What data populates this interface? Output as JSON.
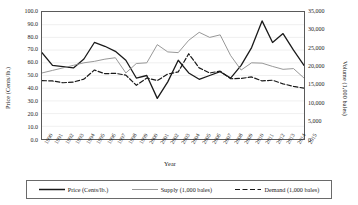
{
  "chart_data": {
    "type": "line",
    "title": "",
    "xlabel": "Year",
    "ylabel": "Price (Cents/lb.)",
    "y2label": "Volume (1,000 bales)",
    "grid": true,
    "legend_position": "bottom",
    "categories": [
      "1990",
      "1991",
      "1992",
      "1993",
      "1994",
      "1995",
      "1996",
      "1997",
      "1998",
      "1999",
      "2000",
      "2001",
      "2002",
      "2003",
      "2004",
      "2005",
      "2006",
      "2007",
      "2008",
      "2009",
      "2010",
      "2011",
      "2012",
      "2013",
      "2014",
      "2015"
    ],
    "ylim": [
      0.0,
      100.0
    ],
    "ytick_step": 10.0,
    "yticks": [
      "100.0",
      "90.0",
      "80.0",
      "70.0",
      "60.0",
      "50.0",
      "40.0",
      "30.0",
      "20.0",
      "10.0",
      "0.0"
    ],
    "y2lim": [
      0,
      35000
    ],
    "y2tick_step": 5000,
    "y2ticks": [
      "35,000",
      "30,000",
      "25,000",
      "20,000",
      "15,000",
      "10,000",
      "5,000",
      "0"
    ],
    "series": [
      {
        "name": "Price (Cents/lb.)",
        "axis": "left",
        "style": "solid",
        "color": "#1a1a1a",
        "width": 1.3,
        "values": [
          68.0,
          58.0,
          57.0,
          56.0,
          63.0,
          76.0,
          73.0,
          69.0,
          62.0,
          48.0,
          50.0,
          32.0,
          45.0,
          62.0,
          52.0,
          47.0,
          50.0,
          53.0,
          48.0,
          58.0,
          72.0,
          93.0,
          76.0,
          83.0,
          70.0,
          58.0
        ]
      },
      {
        "name": "Supply (1,000 bales)",
        "axis": "right",
        "style": "thin-solid",
        "color": "#8c8c8c",
        "width": 0.9,
        "values": [
          18200,
          18900,
          19600,
          20300,
          21000,
          21400,
          22000,
          22400,
          18200,
          20800,
          21000,
          26000,
          24000,
          23800,
          27200,
          29400,
          28000,
          28700,
          23000,
          19000,
          21000,
          20900,
          20000,
          19200,
          19400,
          16800
        ]
      },
      {
        "name": "Demand (1,000 bales)",
        "axis": "right",
        "style": "dashed",
        "color": "#1a1a1a",
        "width": 1.2,
        "values": [
          16100,
          16000,
          15500,
          15700,
          16500,
          19000,
          18000,
          18100,
          17600,
          14800,
          16800,
          16100,
          17900,
          18500,
          23500,
          19600,
          18200,
          18700,
          16600,
          16700,
          17100,
          16000,
          16200,
          15200,
          14500,
          14000
        ]
      }
    ]
  },
  "legend": {
    "items": [
      {
        "label": "Price (Cents/lb.)",
        "style": "solid"
      },
      {
        "label": "Supply (1,000 bales)",
        "style": "thin-solid"
      },
      {
        "label": "Demand (1,000 bales)",
        "style": "dashed"
      }
    ]
  }
}
